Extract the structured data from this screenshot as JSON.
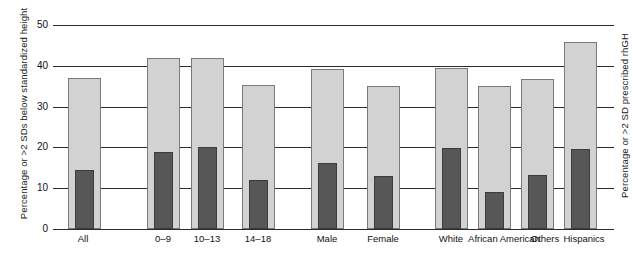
{
  "chart_data": {
    "type": "bar",
    "title": "",
    "xlabel": "",
    "ylabel": "Percentage or >2 SDs below standardized height",
    "ylabel_right": "Percentage or >2 SD prescribed rhGH",
    "ylim": [
      0,
      50
    ],
    "yticks": [
      0,
      10,
      20,
      30,
      40,
      50
    ],
    "grid": true,
    "legend": "none",
    "categories": [
      "All",
      "0–9",
      "10–13",
      "14–18",
      "Male",
      "Female",
      "White",
      "African American",
      "Others",
      "Hispanics"
    ],
    "series": [
      {
        "name": "Percentage or >2 SDs below standardized height",
        "color": "#d2d2d2",
        "values": [
          37,
          42,
          42,
          35.2,
          39.2,
          35,
          39.4,
          35,
          36.7,
          45.8
        ]
      },
      {
        "name": "Percentage or >2 SD prescribed rhGH",
        "color": "#575757",
        "values": [
          14.4,
          18.8,
          20.2,
          12.1,
          16.2,
          12.9,
          19.8,
          9,
          13.3,
          19.6
        ]
      }
    ],
    "groups": [
      {
        "name": "overall",
        "categories": [
          "All"
        ]
      },
      {
        "name": "age",
        "categories": [
          "0–9",
          "10–13",
          "14–18"
        ]
      },
      {
        "name": "sex",
        "categories": [
          "Male",
          "Female"
        ]
      },
      {
        "name": "race",
        "categories": [
          "White",
          "African American",
          "Others",
          "Hispanics"
        ]
      }
    ]
  },
  "axes": {
    "left_title": "Percentage or >2 SDs below standardized height",
    "right_title": "Percentage or >2 SD prescribed rhGH",
    "ticks": [
      "50",
      "40",
      "30",
      "20",
      "10",
      "0"
    ]
  },
  "xlabels": [
    {
      "text": "All",
      "x": 83
    },
    {
      "text": "0–9",
      "x": 163
    },
    {
      "text": "10–13",
      "x": 207
    },
    {
      "text": "14–18",
      "x": 258
    },
    {
      "text": "Male",
      "x": 327
    },
    {
      "text": "Female",
      "x": 383
    },
    {
      "text": "White",
      "x": 451
    },
    {
      "text": "African American",
      "x": 504
    },
    {
      "text": "Others",
      "x": 545
    },
    {
      "text": "Hispanics",
      "x": 584
    }
  ],
  "bars": [
    {
      "cat": "All",
      "light_x": 68,
      "light_w": 33,
      "light_v": 37,
      "dark_x": 75,
      "dark_w": 19,
      "dark_v": 14.4
    },
    {
      "cat": "0–9",
      "light_x": 147,
      "light_w": 33,
      "light_v": 42,
      "dark_x": 154,
      "dark_w": 19,
      "dark_v": 18.8
    },
    {
      "cat": "10–13",
      "light_x": 191,
      "light_w": 33,
      "light_v": 42,
      "dark_x": 198,
      "dark_w": 19,
      "dark_v": 20.2
    },
    {
      "cat": "14–18",
      "light_x": 242,
      "light_w": 33,
      "light_v": 35.2,
      "dark_x": 249,
      "dark_w": 19,
      "dark_v": 12.1
    },
    {
      "cat": "Male",
      "light_x": 311,
      "light_w": 33,
      "light_v": 39.2,
      "dark_x": 318,
      "dark_w": 19,
      "dark_v": 16.2
    },
    {
      "cat": "Female",
      "light_x": 367,
      "light_w": 33,
      "light_v": 35,
      "dark_x": 374,
      "dark_w": 19,
      "dark_v": 12.9
    },
    {
      "cat": "White",
      "light_x": 435,
      "light_w": 33,
      "light_v": 39.4,
      "dark_x": 442,
      "dark_w": 19,
      "dark_v": 19.8
    },
    {
      "cat": "African American",
      "light_x": 478,
      "light_w": 33,
      "light_v": 35,
      "dark_x": 485,
      "dark_w": 19,
      "dark_v": 9
    },
    {
      "cat": "Others",
      "light_x": 521,
      "light_w": 33,
      "light_v": 36.7,
      "dark_x": 528,
      "dark_w": 19,
      "dark_v": 13.3
    },
    {
      "cat": "Hispanics",
      "light_x": 564,
      "light_w": 33,
      "light_v": 45.8,
      "dark_x": 571,
      "dark_w": 19,
      "dark_v": 19.6
    }
  ]
}
